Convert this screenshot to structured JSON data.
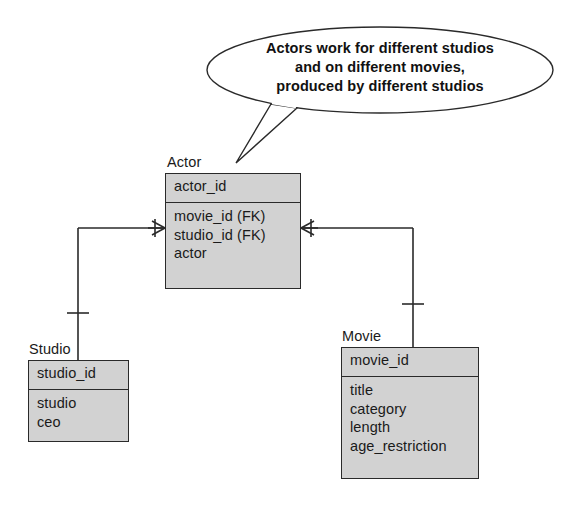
{
  "diagram": {
    "kind": "er-diagram",
    "background_color": "#ffffff",
    "entity_fill_color": "#d2d2d2",
    "line_color": "#2a2a2a"
  },
  "callout": {
    "name": "speech-bubble",
    "lines": [
      "Actors work for different studios",
      "and on different movies,",
      "produced by different studios"
    ],
    "points_to": "Actor"
  },
  "entities": {
    "actor": {
      "title": "Actor",
      "key": "actor_id",
      "fields": [
        "movie_id (FK)",
        "studio_id (FK)",
        "actor"
      ]
    },
    "studio": {
      "title": "Studio",
      "key": "studio_id",
      "fields": [
        "studio",
        "ceo"
      ]
    },
    "movie": {
      "title": "Movie",
      "key": "movie_id",
      "fields": [
        "studio",
        "ceo"
      ],
      "fields_list": [
        "title",
        "category",
        "length",
        "age_restriction"
      ]
    }
  },
  "relationships": [
    {
      "name": "studio-to-actor",
      "from": "Studio",
      "to": "Actor",
      "from_cardinality": "one",
      "to_cardinality": "many"
    },
    {
      "name": "movie-to-actor",
      "from": "Movie",
      "to": "Actor",
      "from_cardinality": "one",
      "to_cardinality": "many"
    }
  ]
}
